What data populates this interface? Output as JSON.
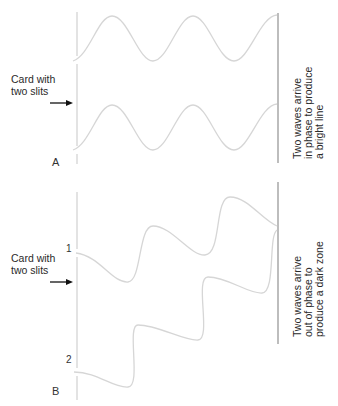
{
  "panels": {
    "A": {
      "letter": "A",
      "card_label_line1": "Card with",
      "card_label_line2": "two slits",
      "result_line1": "Two waves arrive",
      "result_line2": "in phase to produce",
      "result_line3": "a bright line"
    },
    "B": {
      "letter": "B",
      "slit1": "1",
      "slit2": "2",
      "card_label_line1": "Card with",
      "card_label_line2": "two slits",
      "result_line1": "Two waves arrive",
      "result_line2": "out of phase to",
      "result_line3": "produce a dark zone"
    }
  },
  "colors": {
    "wave": "#d6d6d6",
    "card": "#d0d0d0",
    "screen": "#9a9a9a",
    "arrow": "#111111",
    "text": "#2a2a2a"
  }
}
